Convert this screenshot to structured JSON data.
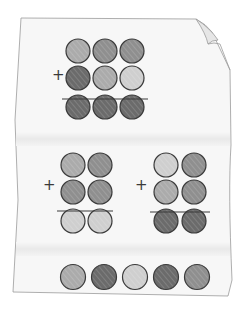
{
  "illustration": {
    "description": "Folded paper worksheet with colored-circle addition puzzles",
    "shades": {
      "light": "#cfcfcf",
      "medium": "#ababab",
      "mediumdark": "#8f8f8f",
      "dark": "#6b6b6b"
    },
    "outline_color": "#3a3a3a",
    "paper_color": "#f7f7f7",
    "plus_sign": "+",
    "puzzles": [
      {
        "name": "top-puzzle",
        "rows": [
          [
            "medium",
            "mediumdark",
            "mediumdark"
          ],
          [
            "dark",
            "medium",
            "light"
          ],
          [
            "dark",
            "dark",
            "dark"
          ]
        ]
      },
      {
        "name": "left-puzzle",
        "rows": [
          [
            "medium",
            "mediumdark"
          ],
          [
            "mediumdark",
            "mediumdark"
          ],
          [
            "light",
            "light"
          ]
        ]
      },
      {
        "name": "right-puzzle",
        "rows": [
          [
            "light",
            "mediumdark"
          ],
          [
            "medium",
            "mediumdark"
          ],
          [
            "dark",
            "dark"
          ]
        ]
      }
    ],
    "answer_row": [
      "medium",
      "dark",
      "light",
      "dark",
      "mediumdark"
    ]
  }
}
